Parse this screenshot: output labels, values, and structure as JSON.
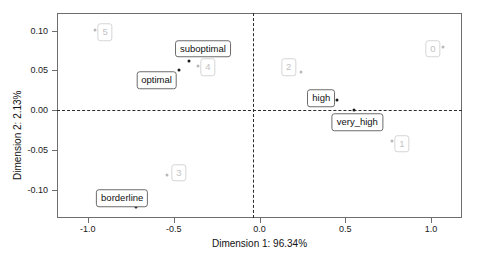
{
  "chart_data": {
    "type": "scatter",
    "title": "",
    "xlabel": "Dimension 1: 96.34%",
    "ylabel": "Dimension 2: 2.13%",
    "xlim": [
      -1.18,
      1.18
    ],
    "ylim": [
      -0.135,
      0.122
    ],
    "xticks": [
      -1.0,
      -0.5,
      0.0,
      0.5,
      1.0
    ],
    "xticklabels": [
      "-1.0",
      "-0.5",
      "0.0",
      "0.5",
      "1.0"
    ],
    "yticks": [
      0.1,
      0.05,
      0.0,
      -0.05,
      -0.1
    ],
    "yticklabels": [
      "0.10",
      "0.05",
      "0.00",
      "-0.05",
      "-0.10"
    ],
    "grid": false,
    "legend": "none",
    "reference_lines": {
      "horizontal": 0.0,
      "vertical": 0.0,
      "style": "dashed"
    },
    "series": [
      {
        "name": "categories",
        "style": "dark",
        "points": [
          {
            "label": "optimal",
            "x": -0.47,
            "y": 0.05,
            "label_x": -0.6,
            "label_y": 0.038
          },
          {
            "label": "suboptimal",
            "x": -0.41,
            "y": 0.062,
            "label_x": -0.33,
            "label_y": 0.077
          },
          {
            "label": "high",
            "x": 0.45,
            "y": 0.013,
            "label_x": 0.36,
            "label_y": 0.015
          },
          {
            "label": "very_high",
            "x": 0.55,
            "y": 0.0,
            "label_x": 0.57,
            "label_y": -0.015
          },
          {
            "label": "borderline",
            "x": -0.72,
            "y": -0.121,
            "label_x": -0.8,
            "label_y": -0.11
          }
        ]
      },
      {
        "name": "clusters",
        "style": "faint",
        "points": [
          {
            "label": "5",
            "x": -0.96,
            "y": 0.101,
            "label_x": -0.9,
            "label_y": 0.098
          },
          {
            "label": "4",
            "x": -0.36,
            "y": 0.056,
            "label_x": -0.3,
            "label_y": 0.054
          },
          {
            "label": "2",
            "x": 0.24,
            "y": 0.048,
            "label_x": 0.17,
            "label_y": 0.054
          },
          {
            "label": "0",
            "x": 1.07,
            "y": 0.08,
            "label_x": 1.01,
            "label_y": 0.077
          },
          {
            "label": "1",
            "x": 0.77,
            "y": -0.038,
            "label_x": 0.83,
            "label_y": -0.042
          },
          {
            "label": "3",
            "x": -0.54,
            "y": -0.081,
            "label_x": -0.47,
            "label_y": -0.078
          }
        ]
      }
    ]
  }
}
